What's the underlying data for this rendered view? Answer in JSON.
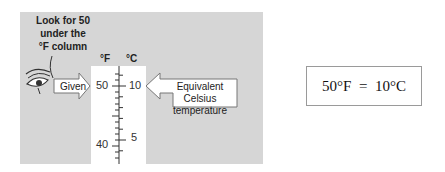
{
  "diagram": {
    "note_lines": [
      "Look for 50",
      "under the",
      "°F column"
    ],
    "thermometer": {
      "fahrenheit_header": "°F",
      "celsius_header": "°C",
      "fahrenheit_labels": [
        "50",
        "40"
      ],
      "celsius_labels": [
        "10",
        "5"
      ]
    },
    "given_label": "Given",
    "equivalent_label_lines": [
      "Equivalent Celsius",
      "temperature"
    ],
    "result": "50°F  =  10°C"
  }
}
